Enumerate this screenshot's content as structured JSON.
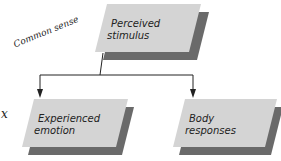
{
  "diagram": {
    "nodes": [
      {
        "id": "perceived-stimulus",
        "line1": "Perceived",
        "line2": "stimulus"
      },
      {
        "id": "experienced-emotion",
        "line1": "Experienced",
        "line2": "emotion"
      },
      {
        "id": "body-responses",
        "line1": "Body",
        "line2": "responses"
      }
    ],
    "edges": [
      {
        "from": "perceived-stimulus",
        "to": "experienced-emotion"
      },
      {
        "from": "perceived-stimulus",
        "to": "body-responses"
      }
    ],
    "annotations": {
      "handwritten_note": "Common sense",
      "handwritten_mark": "x"
    },
    "colors": {
      "box_face": "#d4d4d4",
      "box_shadow": "#6a6a6a",
      "line": "#222222"
    }
  }
}
